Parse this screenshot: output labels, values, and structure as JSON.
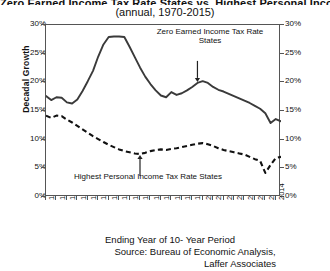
{
  "title": {
    "main": "Zero Earned Income Tax Rate States vs. Highest Personal Income Tax Rate States",
    "sub": "(annual, 1970-2015)"
  },
  "axes": {
    "ylabel": "Decadal Growth",
    "yticks": [
      "0%",
      "5%",
      "10%",
      "15%",
      "20%",
      "25%",
      "30%"
    ],
    "xlabel_line1": "Ending Year of 10- Year Period",
    "source_line1": "Source: Bureau of Economic Analysis,",
    "source_line2": "Laffer Associates"
  },
  "annotations": {
    "top_line1": "Zero Earned Income Tax Rate",
    "top_line2": "States",
    "bottom": "Highest Personal Income Tax Rate States"
  },
  "colors": {
    "series_zero": "#3a3a3a",
    "series_highest": "#111111",
    "axis": "#555555"
  },
  "chart_data": {
    "type": "line",
    "title": "Zero Earned Income Tax Rate States vs. Highest Personal Income Tax Rate States",
    "subtitle": "(annual, 1970-2015)",
    "xlabel": "Ending Year of 10- Year Period",
    "ylabel": "Decadal Growth",
    "ylim": [
      0,
      30
    ],
    "xlim": [
      1970,
      2015
    ],
    "ytick_values": [
      0,
      5,
      10,
      15,
      20,
      25,
      30
    ],
    "ytick_labels": [
      "0%",
      "5%",
      "10%",
      "15%",
      "20%",
      "25%",
      "30%"
    ],
    "xtick_labels": [
      "1970",
      "1972",
      "1974",
      "1976",
      "1978",
      "1980",
      "1982",
      "1984",
      "1986",
      "1988",
      "1990",
      "1992",
      "1994",
      "1996",
      "1998",
      "2000",
      "2002",
      "2004",
      "2006",
      "2008",
      "2010",
      "2012",
      "2014"
    ],
    "grid": false,
    "legend_position": "inline-annotations",
    "x": [
      1970,
      1971,
      1972,
      1973,
      1974,
      1975,
      1976,
      1977,
      1978,
      1979,
      1980,
      1981,
      1982,
      1983,
      1984,
      1985,
      1986,
      1987,
      1988,
      1989,
      1990,
      1991,
      1992,
      1993,
      1994,
      1995,
      1996,
      1997,
      1998,
      1999,
      2000,
      2001,
      2002,
      2003,
      2004,
      2005,
      2006,
      2007,
      2008,
      2009,
      2010,
      2011,
      2012,
      2013,
      2014,
      2015
    ],
    "series": [
      {
        "name": "Zero Earned Income Tax Rate States",
        "style": "solid",
        "values": [
          17.6,
          16.9,
          17.4,
          17.3,
          16.5,
          16.3,
          17.0,
          18.5,
          20.2,
          22.0,
          24.5,
          26.6,
          27.9,
          28.0,
          28.0,
          27.9,
          26.2,
          24.4,
          22.6,
          21.0,
          19.7,
          18.6,
          17.7,
          17.4,
          18.3,
          17.8,
          18.1,
          18.6,
          19.2,
          19.9,
          20.2,
          19.9,
          19.2,
          18.7,
          18.4,
          18.0,
          17.6,
          17.2,
          16.8,
          16.4,
          15.9,
          15.4,
          14.6,
          12.9,
          13.6,
          13.2
        ]
      },
      {
        "name": "Highest Personal Income Tax Rate States",
        "style": "dashed",
        "values": [
          14.2,
          13.8,
          14.2,
          14.1,
          13.5,
          13.0,
          12.4,
          11.8,
          11.2,
          10.6,
          10.1,
          9.6,
          9.1,
          8.7,
          8.3,
          8.0,
          7.8,
          7.6,
          7.5,
          7.7,
          8.0,
          8.2,
          8.3,
          8.2,
          8.4,
          8.5,
          8.7,
          8.9,
          9.1,
          9.3,
          9.4,
          9.2,
          8.9,
          8.5,
          8.2,
          8.0,
          7.8,
          7.6,
          7.4,
          7.0,
          6.6,
          6.3,
          4.2,
          5.6,
          6.8,
          7.0
        ]
      }
    ],
    "annotations": [
      {
        "text": "Zero Earned Income Tax Rate States",
        "points_to_year": 1999,
        "points_to_value": 19.9,
        "arrow": "down"
      },
      {
        "text": "Highest Personal Income Tax Rate States",
        "points_to_year": 1988,
        "points_to_value": 7.5,
        "arrow": "up"
      }
    ]
  }
}
